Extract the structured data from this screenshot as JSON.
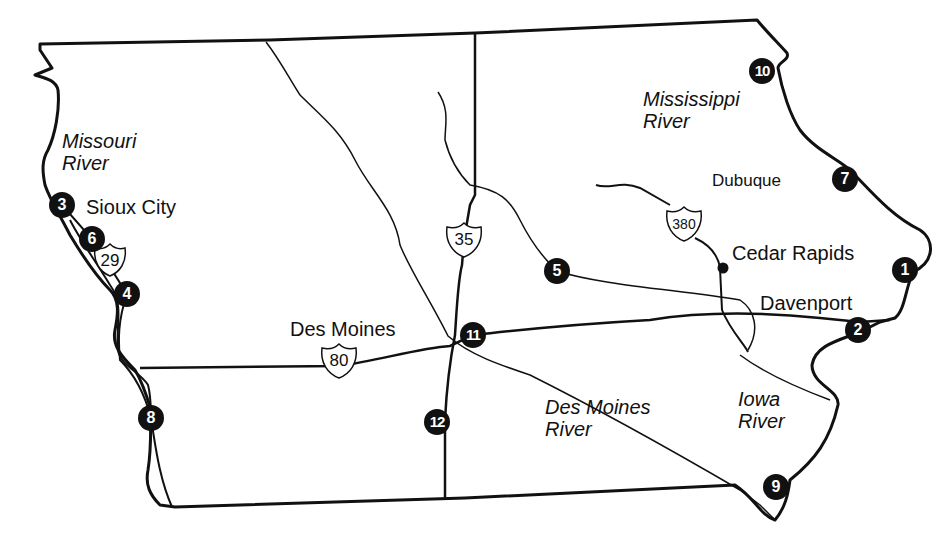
{
  "map": {
    "region": "Iowa",
    "cities": [
      {
        "name": "Sioux City",
        "x": 86,
        "y": 196
      },
      {
        "name": "Dubuque",
        "x": 712,
        "y": 170
      },
      {
        "name": "Cedar Rapids",
        "x": 732,
        "y": 242
      },
      {
        "name": "Davenport",
        "x": 760,
        "y": 292
      },
      {
        "name": "Des Moines",
        "x": 290,
        "y": 318
      }
    ],
    "rivers": [
      {
        "name_line1": "Missouri",
        "name_line2": "River",
        "x": 62,
        "y": 130
      },
      {
        "name_line1": "Mississippi",
        "name_line2": "River",
        "x": 643,
        "y": 88
      },
      {
        "name_line1": "Des Moines",
        "name_line2": "River",
        "x": 545,
        "y": 396
      },
      {
        "name_line1": "Iowa",
        "name_line2": "River",
        "x": 738,
        "y": 388
      }
    ],
    "interstates": [
      {
        "number": "29",
        "x": 110,
        "y": 260
      },
      {
        "number": "35",
        "x": 464,
        "y": 240
      },
      {
        "number": "80",
        "x": 339,
        "y": 361
      },
      {
        "number": "380",
        "x": 684,
        "y": 224
      }
    ],
    "markers": [
      {
        "number": "1",
        "x": 905,
        "y": 270
      },
      {
        "number": "2",
        "x": 858,
        "y": 330
      },
      {
        "number": "3",
        "x": 62,
        "y": 205
      },
      {
        "number": "4",
        "x": 127,
        "y": 294
      },
      {
        "number": "5",
        "x": 557,
        "y": 271
      },
      {
        "number": "6",
        "x": 92,
        "y": 239
      },
      {
        "number": "7",
        "x": 845,
        "y": 179
      },
      {
        "number": "8",
        "x": 151,
        "y": 418
      },
      {
        "number": "9",
        "x": 776,
        "y": 487
      },
      {
        "number": "10",
        "x": 762,
        "y": 71
      },
      {
        "number": "11",
        "x": 473,
        "y": 335
      },
      {
        "number": "12",
        "x": 437,
        "y": 422
      }
    ]
  }
}
